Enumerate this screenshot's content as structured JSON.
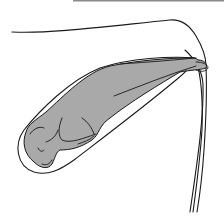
{
  "diagram": {
    "colors": {
      "background": "#ffffff",
      "line": "#1a1a1a",
      "fetus_fill": "#a9a9a9",
      "top_border": "#8a8a8a"
    },
    "elements": [
      "abdomen-outline",
      "uterus-outline",
      "fetus",
      "fetus-head",
      "fetus-forelimbs",
      "fetus-hindlimbs",
      "birth-canal-lines"
    ]
  }
}
